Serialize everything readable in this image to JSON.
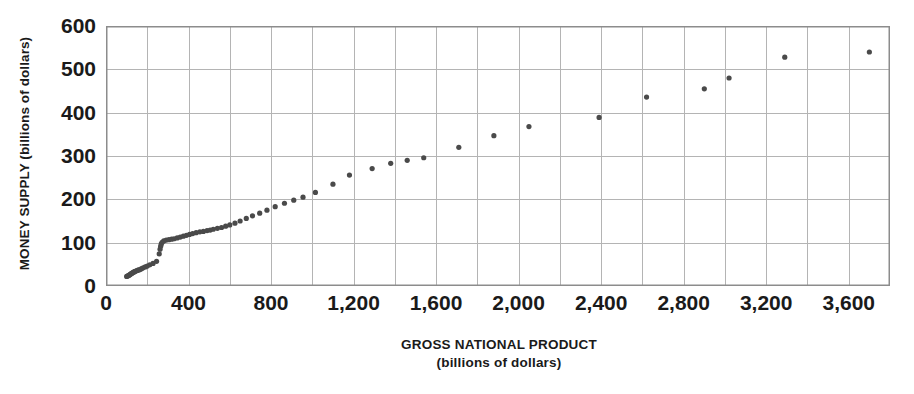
{
  "chart_data": {
    "type": "scatter",
    "title": "",
    "xlabel": "GROSS NATIONAL PRODUCT",
    "xlabel_sub": "(billions of dollars)",
    "ylabel": "MONEY SUPPLY (billions of dollars)",
    "xlim": [
      0,
      3800
    ],
    "ylim": [
      0,
      600
    ],
    "grid": true,
    "grid_x_step": 200,
    "grid_y_step": 100,
    "legend": "none",
    "xticks": [
      0,
      400,
      800,
      1200,
      1600,
      2000,
      2400,
      2800,
      3200,
      3600
    ],
    "xtick_labels": [
      "0",
      "400",
      "800",
      "1,200",
      "1,600",
      "2,000",
      "2,400",
      "2,800",
      "3,200",
      "3,600"
    ],
    "yticks": [
      0,
      100,
      200,
      300,
      400,
      500,
      600
    ],
    "ytick_labels": [
      "0",
      "100",
      "200",
      "300",
      "400",
      "500",
      "600"
    ],
    "marker_color": "#4a4a4a",
    "marker_size": 2.6,
    "axis_color": "#8c8c8c",
    "grid_color": "#b4b4b4",
    "series": [
      {
        "name": "Money supply vs GNP",
        "points": [
          [
            100,
            22
          ],
          [
            105,
            23
          ],
          [
            108,
            24
          ],
          [
            112,
            25
          ],
          [
            115,
            26
          ],
          [
            118,
            27
          ],
          [
            121,
            28
          ],
          [
            124,
            29
          ],
          [
            127,
            30
          ],
          [
            130,
            31
          ],
          [
            134,
            32
          ],
          [
            138,
            33
          ],
          [
            142,
            34
          ],
          [
            147,
            35
          ],
          [
            152,
            36
          ],
          [
            158,
            37
          ],
          [
            165,
            38
          ],
          [
            172,
            40
          ],
          [
            180,
            42
          ],
          [
            190,
            44
          ],
          [
            200,
            46
          ],
          [
            212,
            49
          ],
          [
            228,
            52
          ],
          [
            245,
            57
          ],
          [
            258,
            74
          ],
          [
            262,
            85
          ],
          [
            265,
            92
          ],
          [
            268,
            97
          ],
          [
            272,
            101
          ],
          [
            280,
            104
          ],
          [
            292,
            106
          ],
          [
            305,
            107
          ],
          [
            318,
            108
          ],
          [
            330,
            109
          ],
          [
            345,
            111
          ],
          [
            360,
            113
          ],
          [
            375,
            115
          ],
          [
            390,
            117
          ],
          [
            405,
            119
          ],
          [
            420,
            121
          ],
          [
            437,
            123
          ],
          [
            455,
            125
          ],
          [
            472,
            126
          ],
          [
            490,
            128
          ],
          [
            505,
            129
          ],
          [
            520,
            131
          ],
          [
            540,
            133
          ],
          [
            560,
            135
          ],
          [
            580,
            138
          ],
          [
            600,
            141
          ],
          [
            625,
            145
          ],
          [
            650,
            150
          ],
          [
            680,
            156
          ],
          [
            710,
            162
          ],
          [
            745,
            168
          ],
          [
            780,
            175
          ],
          [
            820,
            183
          ],
          [
            865,
            191
          ],
          [
            910,
            198
          ],
          [
            955,
            205
          ],
          [
            1015,
            216
          ],
          [
            1100,
            235
          ],
          [
            1180,
            256
          ],
          [
            1290,
            271
          ],
          [
            1380,
            283
          ],
          [
            1460,
            290
          ],
          [
            1540,
            296
          ],
          [
            1710,
            320
          ],
          [
            1880,
            347
          ],
          [
            2050,
            368
          ],
          [
            2390,
            389
          ],
          [
            2620,
            436
          ],
          [
            2900,
            455
          ],
          [
            3020,
            480
          ],
          [
            3290,
            528
          ],
          [
            3700,
            540
          ]
        ]
      }
    ]
  },
  "axis_titles": {
    "x_main": "GROSS NATIONAL PRODUCT",
    "x_sub": "(billions of dollars)",
    "y_main": "MONEY SUPPLY (billions of dollars)"
  }
}
